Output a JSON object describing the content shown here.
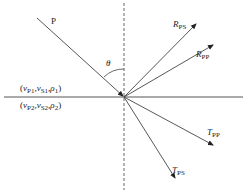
{
  "diagram": {
    "type": "seismic-wave-reflection-transmission",
    "incident_wave": {
      "label": "P"
    },
    "angle": {
      "label": "θ"
    },
    "upper_medium": {
      "label_parts": [
        "(",
        "v",
        "P1",
        ",",
        "v",
        "S1",
        ",",
        "ρ",
        "1",
        ")"
      ]
    },
    "lower_medium": {
      "label_parts": [
        "(",
        "v",
        "P2",
        ",",
        "v",
        "S2",
        ",",
        "ρ",
        "2",
        ")"
      ]
    },
    "rays": {
      "rps": {
        "main": "R",
        "sub": "PS"
      },
      "rpp": {
        "main": "R",
        "sub": "PP"
      },
      "tpp": {
        "main": "T",
        "sub": "PP"
      },
      "tps": {
        "main": "T",
        "sub": "PS"
      }
    },
    "colors": {
      "line": "#333333",
      "dashed": "#555555",
      "text": "#222222"
    }
  }
}
